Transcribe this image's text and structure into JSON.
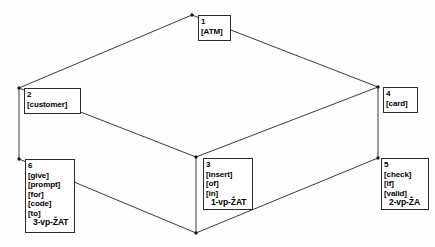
{
  "diagram": {
    "type": "3d-wireframe-annotated",
    "stroke_color": "#3a3a3a",
    "text_color": "#000000",
    "background_color": "#fefefe",
    "nodes": [
      {
        "id": "1",
        "lines": [
          "[ATM]"
        ],
        "tag": "",
        "x": 198,
        "y": 15,
        "w": 33,
        "h": 26
      },
      {
        "id": "2",
        "lines": [
          "[customer]"
        ],
        "tag": "",
        "x": 24,
        "y": 88,
        "w": 57,
        "h": 26
      },
      {
        "id": "4",
        "lines": [
          "[card]"
        ],
        "tag": "",
        "x": 383,
        "y": 87,
        "w": 35,
        "h": 26
      },
      {
        "id": "3",
        "lines": [
          "[insert]",
          "[of]",
          "[in]"
        ],
        "tag": "1-vp-ŽAT",
        "x": 203,
        "y": 158,
        "w": 50,
        "h": 52
      },
      {
        "id": "5",
        "lines": [
          "[check]",
          "[if]",
          "[valid]"
        ],
        "tag": "2-vp-ŽA",
        "x": 381,
        "y": 158,
        "w": 48,
        "h": 52
      },
      {
        "id": "6",
        "lines": [
          "[give]",
          "[prompt]",
          "[for]",
          "[code]",
          "[to]"
        ],
        "tag": "3-vp-ŽAT",
        "x": 25,
        "y": 159,
        "w": 50,
        "h": 74
      }
    ],
    "vertices": [
      {
        "name": "top-rear",
        "x": 192,
        "y": 15
      },
      {
        "name": "left-rear",
        "x": 19,
        "y": 88
      },
      {
        "name": "right-rear",
        "x": 378,
        "y": 87
      },
      {
        "name": "center-front-top",
        "x": 196,
        "y": 157
      },
      {
        "name": "left-front-bottom",
        "x": 19,
        "y": 159
      },
      {
        "name": "right-front-bottom",
        "x": 378,
        "y": 158
      },
      {
        "name": "center-front-bottom",
        "x": 196,
        "y": 233
      }
    ],
    "edges": [
      {
        "from": "left-rear",
        "to": "top-rear"
      },
      {
        "from": "top-rear",
        "to": "right-rear"
      },
      {
        "from": "left-rear",
        "to": "center-front-top"
      },
      {
        "from": "center-front-top",
        "to": "right-rear"
      },
      {
        "from": "left-rear",
        "to": "left-front-bottom"
      },
      {
        "from": "right-rear",
        "to": "right-front-bottom"
      },
      {
        "from": "center-front-top",
        "to": "center-front-bottom"
      },
      {
        "from": "left-front-bottom",
        "to": "center-front-bottom"
      },
      {
        "from": "center-front-bottom",
        "to": "right-front-bottom"
      }
    ]
  }
}
